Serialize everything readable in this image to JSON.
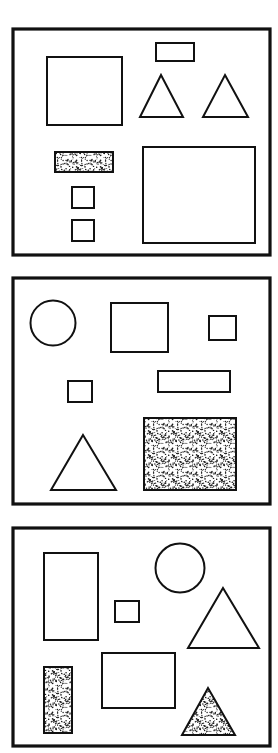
{
  "figure": {
    "width": 278,
    "height": 753,
    "background_color": "#ffffff",
    "stroke_color": "#111111",
    "stipple_color": "#1a1a1a",
    "panel_border_width": 3.2,
    "shape_border_width": 2.0
  },
  "panels": [
    {
      "id": "panel-1",
      "label": "Panel 1",
      "frame": {
        "x": 13,
        "y": 29,
        "width": 257,
        "height": 226
      },
      "shapes": [
        {
          "name": "large-square-left",
          "type": "rect",
          "fill": "none",
          "x": 47,
          "y": 57,
          "width": 75,
          "height": 68
        },
        {
          "name": "small-rectangle-top",
          "type": "rect",
          "fill": "none",
          "x": 156,
          "y": 43,
          "width": 38,
          "height": 18
        },
        {
          "name": "triangle-middle",
          "type": "triangle",
          "fill": "none",
          "apex_x": 161,
          "apex_y": 75,
          "base_left_x": 140,
          "base_right_x": 183,
          "base_y": 117
        },
        {
          "name": "triangle-right",
          "type": "triangle",
          "fill": "none",
          "apex_x": 225,
          "apex_y": 75,
          "base_left_x": 203,
          "base_right_x": 248,
          "base_y": 117
        },
        {
          "name": "stippled-rectangle",
          "type": "rect",
          "fill": "stipple",
          "x": 55,
          "y": 152,
          "width": 58,
          "height": 20
        },
        {
          "name": "small-square-upper",
          "type": "rect",
          "fill": "none",
          "x": 72,
          "y": 187,
          "width": 22,
          "height": 21
        },
        {
          "name": "small-square-lower",
          "type": "rect",
          "fill": "none",
          "x": 72,
          "y": 220,
          "width": 22,
          "height": 21
        },
        {
          "name": "large-square-right",
          "type": "rect",
          "fill": "none",
          "x": 143,
          "y": 147,
          "width": 112,
          "height": 96
        }
      ]
    },
    {
      "id": "panel-2",
      "label": "Panel 2",
      "frame": {
        "x": 13,
        "y": 278,
        "width": 257,
        "height": 226
      },
      "shapes": [
        {
          "name": "circle-left",
          "type": "circle",
          "fill": "none",
          "cx": 53,
          "cy": 323,
          "r": 22.5
        },
        {
          "name": "square-top-middle",
          "type": "rect",
          "fill": "none",
          "x": 111,
          "y": 303,
          "width": 57,
          "height": 49
        },
        {
          "name": "small-square-top-right",
          "type": "rect",
          "fill": "none",
          "x": 209,
          "y": 316,
          "width": 27,
          "height": 24
        },
        {
          "name": "small-square-middle-left",
          "type": "rect",
          "fill": "none",
          "x": 68,
          "y": 381,
          "width": 24,
          "height": 21
        },
        {
          "name": "wide-rectangle-middle",
          "type": "rect",
          "fill": "none",
          "x": 158,
          "y": 371,
          "width": 72,
          "height": 21
        },
        {
          "name": "triangle-bottom-left",
          "type": "triangle",
          "fill": "none",
          "apex_x": 83,
          "apex_y": 435,
          "base_left_x": 51,
          "base_right_x": 116,
          "base_y": 490
        },
        {
          "name": "stippled-square-bottom",
          "type": "rect",
          "fill": "stipple",
          "x": 144,
          "y": 418,
          "width": 92,
          "height": 72
        }
      ]
    },
    {
      "id": "panel-3",
      "label": "Panel 3",
      "frame": {
        "x": 13,
        "y": 528,
        "width": 257,
        "height": 218
      },
      "shapes": [
        {
          "name": "tall-rectangle-left",
          "type": "rect",
          "fill": "none",
          "x": 44,
          "y": 553,
          "width": 54,
          "height": 87
        },
        {
          "name": "small-square-middle",
          "type": "rect",
          "fill": "none",
          "x": 115,
          "y": 601,
          "width": 24,
          "height": 21
        },
        {
          "name": "circle-top-right",
          "type": "circle",
          "fill": "none",
          "cx": 180,
          "cy": 568,
          "r": 24.5
        },
        {
          "name": "triangle-right",
          "type": "triangle",
          "fill": "none",
          "apex_x": 223,
          "apex_y": 588,
          "base_left_x": 188,
          "base_right_x": 259,
          "base_y": 648
        },
        {
          "name": "stippled-tall-rectangle",
          "type": "rect",
          "fill": "stipple",
          "x": 44,
          "y": 667,
          "width": 28,
          "height": 66
        },
        {
          "name": "square-bottom-middle",
          "type": "rect",
          "fill": "none",
          "x": 102,
          "y": 653,
          "width": 73,
          "height": 55
        },
        {
          "name": "stippled-triangle",
          "type": "triangle",
          "fill": "stipple",
          "apex_x": 208,
          "apex_y": 688,
          "base_left_x": 182,
          "base_right_x": 235,
          "base_y": 735
        }
      ]
    }
  ]
}
